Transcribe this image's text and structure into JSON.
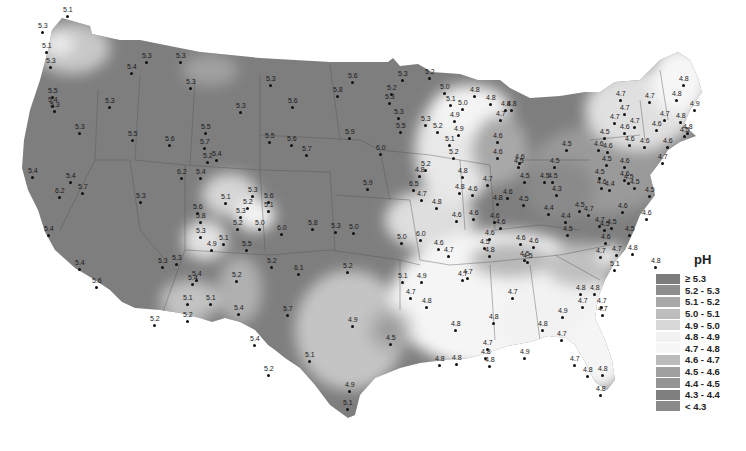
{
  "map": {
    "title": "Precipitation pH, contiguous United States",
    "legend": {
      "title": "pH",
      "items": [
        {
          "label": "≥ 5.3",
          "color": "#7c7c7c"
        },
        {
          "label": "5.2 - 5.3",
          "color": "#8e8e8e"
        },
        {
          "label": "5.1 - 5.2",
          "color": "#a8a8a8"
        },
        {
          "label": "5.0 - 5.1",
          "color": "#bdbdbd"
        },
        {
          "label": "4.9 - 5.0",
          "color": "#d8d8d8"
        },
        {
          "label": "4.8 - 4.9",
          "color": "#f2f2f2"
        },
        {
          "label": "4.7 - 4.8",
          "color": "#f7f7f7"
        },
        {
          "label": "4.6 - 4.7",
          "color": "#bcbcbc"
        },
        {
          "label": "4.5 - 4.6",
          "color": "#a0a0a0"
        },
        {
          "label": "4.4 - 4.5",
          "color": "#949494"
        },
        {
          "label": "4.3 - 4.4",
          "color": "#7e7e7e"
        },
        {
          "label": "< 4.3",
          "color": "#8a8a8a"
        }
      ]
    },
    "stations": [
      {
        "v": "5.1",
        "x": 63,
        "y": 6
      },
      {
        "v": "5.3",
        "x": 38,
        "y": 22
      },
      {
        "v": "5.1",
        "x": 42,
        "y": 42
      },
      {
        "v": "5.3",
        "x": 46,
        "y": 57
      },
      {
        "v": "5.4",
        "x": 127,
        "y": 63
      },
      {
        "v": "5.3",
        "x": 142,
        "y": 52
      },
      {
        "v": "5.3",
        "x": 176,
        "y": 52
      },
      {
        "v": "5.3",
        "x": 186,
        "y": 78
      },
      {
        "v": "5.5",
        "x": 48,
        "y": 87
      },
      {
        "v": "5.4",
        "x": 48,
        "y": 96
      },
      {
        "v": "5.3",
        "x": 50,
        "y": 101
      },
      {
        "v": "5.3",
        "x": 105,
        "y": 97
      },
      {
        "v": "5.3",
        "x": 75,
        "y": 123
      },
      {
        "v": "5.5",
        "x": 128,
        "y": 130
      },
      {
        "v": "5.6",
        "x": 165,
        "y": 135
      },
      {
        "v": "5.5",
        "x": 201,
        "y": 123
      },
      {
        "v": "5.3",
        "x": 266,
        "y": 75
      },
      {
        "v": "5.6",
        "x": 348,
        "y": 72
      },
      {
        "v": "5.8",
        "x": 333,
        "y": 86
      },
      {
        "v": "5.6",
        "x": 288,
        "y": 97
      },
      {
        "v": "5.3",
        "x": 236,
        "y": 102
      },
      {
        "v": "5.5",
        "x": 265,
        "y": 132
      },
      {
        "v": "5.6",
        "x": 287,
        "y": 135
      },
      {
        "v": "5.7",
        "x": 302,
        "y": 145
      },
      {
        "v": "5.9",
        "x": 345,
        "y": 128
      },
      {
        "v": "6.0",
        "x": 376,
        "y": 144
      },
      {
        "v": "5.2",
        "x": 425,
        "y": 68
      },
      {
        "v": "5.3",
        "x": 398,
        "y": 70
      },
      {
        "v": "5.2",
        "x": 387,
        "y": 84
      },
      {
        "v": "5.3",
        "x": 385,
        "y": 93
      },
      {
        "v": "5.3",
        "x": 394,
        "y": 108
      },
      {
        "v": "5.5",
        "x": 396,
        "y": 122
      },
      {
        "v": "5.0",
        "x": 440,
        "y": 83
      },
      {
        "v": "4.8",
        "x": 470,
        "y": 86
      },
      {
        "v": "4.8",
        "x": 486,
        "y": 94
      },
      {
        "v": "4.8",
        "x": 501,
        "y": 100
      },
      {
        "v": "5.1",
        "x": 446,
        "y": 95
      },
      {
        "v": "5.0",
        "x": 458,
        "y": 99
      },
      {
        "v": "5.3",
        "x": 421,
        "y": 115
      },
      {
        "v": "4.9",
        "x": 450,
        "y": 111
      },
      {
        "v": "5.2",
        "x": 433,
        "y": 122
      },
      {
        "v": "4.9",
        "x": 454,
        "y": 125
      },
      {
        "v": "5.1",
        "x": 445,
        "y": 135
      },
      {
        "v": "5.2",
        "x": 449,
        "y": 148
      },
      {
        "v": "4.8",
        "x": 458,
        "y": 167
      },
      {
        "v": "4.8",
        "x": 455,
        "y": 183
      },
      {
        "v": "5.2",
        "x": 421,
        "y": 160
      },
      {
        "v": "4.7",
        "x": 496,
        "y": 110
      },
      {
        "v": "4.8",
        "x": 507,
        "y": 100
      },
      {
        "v": "4.6",
        "x": 493,
        "y": 132
      },
      {
        "v": "4.6",
        "x": 493,
        "y": 148
      },
      {
        "v": "4.6",
        "x": 515,
        "y": 153
      },
      {
        "v": "4.5",
        "x": 514,
        "y": 157
      },
      {
        "v": "4.8",
        "x": 679,
        "y": 75
      },
      {
        "v": "4.8",
        "x": 672,
        "y": 90
      },
      {
        "v": "4.9",
        "x": 690,
        "y": 100
      },
      {
        "v": "4.7",
        "x": 616,
        "y": 90
      },
      {
        "v": "4.7",
        "x": 645,
        "y": 92
      },
      {
        "v": "4.7",
        "x": 620,
        "y": 104
      },
      {
        "v": "4.8",
        "x": 676,
        "y": 112
      },
      {
        "v": "4.8",
        "x": 683,
        "y": 123
      },
      {
        "v": "4.7",
        "x": 610,
        "y": 113
      },
      {
        "v": "4.7",
        "x": 660,
        "y": 110
      },
      {
        "v": "4.7",
        "x": 630,
        "y": 117
      },
      {
        "v": "4.6",
        "x": 652,
        "y": 120
      },
      {
        "v": "4.6",
        "x": 620,
        "y": 123
      },
      {
        "v": "4.5",
        "x": 680,
        "y": 126
      },
      {
        "v": "4.5",
        "x": 600,
        "y": 128
      },
      {
        "v": "4.6",
        "x": 594,
        "y": 140
      },
      {
        "v": "4.6",
        "x": 625,
        "y": 135
      },
      {
        "v": "4.6",
        "x": 640,
        "y": 137
      },
      {
        "v": "4.6",
        "x": 603,
        "y": 142
      },
      {
        "v": "4.6",
        "x": 663,
        "y": 137
      },
      {
        "v": "4.7",
        "x": 658,
        "y": 153
      },
      {
        "v": "4.5",
        "x": 562,
        "y": 140
      },
      {
        "v": "4.5",
        "x": 602,
        "y": 155
      },
      {
        "v": "4.6",
        "x": 620,
        "y": 157
      },
      {
        "v": "4.5",
        "x": 540,
        "y": 172
      },
      {
        "v": "4.5",
        "x": 550,
        "y": 157
      },
      {
        "v": "4.6",
        "x": 620,
        "y": 170
      },
      {
        "v": "4.5",
        "x": 595,
        "y": 168
      },
      {
        "v": "4.6",
        "x": 597,
        "y": 178
      },
      {
        "v": "4.4",
        "x": 605,
        "y": 180
      },
      {
        "v": "4.5",
        "x": 624,
        "y": 173
      },
      {
        "v": "4.5",
        "x": 630,
        "y": 178
      },
      {
        "v": "4.5",
        "x": 645,
        "y": 186
      },
      {
        "v": "4.5",
        "x": 520,
        "y": 172
      },
      {
        "v": "4.5",
        "x": 548,
        "y": 172
      },
      {
        "v": "4.3",
        "x": 552,
        "y": 185
      },
      {
        "v": "4.5",
        "x": 519,
        "y": 195
      },
      {
        "v": "4.4",
        "x": 544,
        "y": 204
      },
      {
        "v": "4.5",
        "x": 575,
        "y": 201
      },
      {
        "v": "4.4",
        "x": 561,
        "y": 212
      },
      {
        "v": "4.5",
        "x": 563,
        "y": 225
      },
      {
        "v": "4.7",
        "x": 595,
        "y": 216
      },
      {
        "v": "4.7",
        "x": 584,
        "y": 205
      },
      {
        "v": "4.5",
        "x": 600,
        "y": 220
      },
      {
        "v": "4.6",
        "x": 618,
        "y": 202
      },
      {
        "v": "4.5",
        "x": 607,
        "y": 218
      },
      {
        "v": "4.6",
        "x": 642,
        "y": 209
      },
      {
        "v": "4.5",
        "x": 625,
        "y": 225
      },
      {
        "v": "4.6",
        "x": 601,
        "y": 233
      },
      {
        "v": "4.8",
        "x": 493,
        "y": 194
      },
      {
        "v": "4.7",
        "x": 483,
        "y": 175
      },
      {
        "v": "4.6",
        "x": 503,
        "y": 188
      },
      {
        "v": "4.6",
        "x": 496,
        "y": 218
      },
      {
        "v": "4.6",
        "x": 516,
        "y": 234
      },
      {
        "v": "4.5",
        "x": 480,
        "y": 238
      },
      {
        "v": "4.8",
        "x": 485,
        "y": 246
      },
      {
        "v": "4.6",
        "x": 529,
        "y": 237
      },
      {
        "v": "4.5",
        "x": 523,
        "y": 252
      },
      {
        "v": "4.7",
        "x": 596,
        "y": 247
      },
      {
        "v": "4.7",
        "x": 612,
        "y": 245
      },
      {
        "v": "4.8",
        "x": 628,
        "y": 244
      },
      {
        "v": "5.1",
        "x": 610,
        "y": 260
      },
      {
        "v": "4.8",
        "x": 651,
        "y": 257
      },
      {
        "v": "4.8",
        "x": 415,
        "y": 166
      },
      {
        "v": "4.7",
        "x": 417,
        "y": 190
      },
      {
        "v": "4.8",
        "x": 432,
        "y": 198
      },
      {
        "v": "4.6",
        "x": 468,
        "y": 185
      },
      {
        "v": "4.6",
        "x": 469,
        "y": 209
      },
      {
        "v": "4.6",
        "x": 452,
        "y": 211
      },
      {
        "v": "4.6",
        "x": 490,
        "y": 212
      },
      {
        "v": "5.0",
        "x": 397,
        "y": 233
      },
      {
        "v": "6.0",
        "x": 416,
        "y": 230
      },
      {
        "v": "4.7",
        "x": 444,
        "y": 246
      },
      {
        "v": "4.6",
        "x": 434,
        "y": 239
      },
      {
        "v": "4.6",
        "x": 485,
        "y": 229
      },
      {
        "v": "4.5",
        "x": 520,
        "y": 250
      },
      {
        "v": "4.7",
        "x": 463,
        "y": 268
      },
      {
        "v": "4.7",
        "x": 458,
        "y": 270
      },
      {
        "v": "5.1",
        "x": 398,
        "y": 272
      },
      {
        "v": "4.9",
        "x": 417,
        "y": 272
      },
      {
        "v": "4.7",
        "x": 406,
        "y": 288
      },
      {
        "v": "4.8",
        "x": 422,
        "y": 297
      },
      {
        "v": "4.7",
        "x": 508,
        "y": 288
      },
      {
        "v": "4.8",
        "x": 576,
        "y": 284
      },
      {
        "v": "4.8",
        "x": 590,
        "y": 284
      },
      {
        "v": "4.7",
        "x": 578,
        "y": 297
      },
      {
        "v": "4.7",
        "x": 597,
        "y": 297
      },
      {
        "v": "4.7",
        "x": 598,
        "y": 305
      },
      {
        "v": "4.9",
        "x": 558,
        "y": 307
      },
      {
        "v": "4.8",
        "x": 489,
        "y": 313
      },
      {
        "v": "4.8",
        "x": 451,
        "y": 320
      },
      {
        "v": "4.8",
        "x": 538,
        "y": 320
      },
      {
        "v": "4.7",
        "x": 557,
        "y": 330
      },
      {
        "v": "4.7",
        "x": 483,
        "y": 339
      },
      {
        "v": "4.8",
        "x": 452,
        "y": 354
      },
      {
        "v": "4.9",
        "x": 520,
        "y": 348
      },
      {
        "v": "4.8",
        "x": 481,
        "y": 348
      },
      {
        "v": "4.8",
        "x": 435,
        "y": 355
      },
      {
        "v": "4.8",
        "x": 485,
        "y": 356
      },
      {
        "v": "4.7",
        "x": 570,
        "y": 355
      },
      {
        "v": "4.8",
        "x": 583,
        "y": 366
      },
      {
        "v": "4.8",
        "x": 598,
        "y": 365
      },
      {
        "v": "4.8",
        "x": 596,
        "y": 385
      },
      {
        "v": "4.5",
        "x": 386,
        "y": 334
      },
      {
        "v": "5.2",
        "x": 203,
        "y": 152
      },
      {
        "v": "5.4",
        "x": 212,
        "y": 150
      },
      {
        "v": "5.7",
        "x": 200,
        "y": 138
      },
      {
        "v": "6.2",
        "x": 177,
        "y": 168
      },
      {
        "v": "5.4",
        "x": 196,
        "y": 168
      },
      {
        "v": "5.3",
        "x": 248,
        "y": 186
      },
      {
        "v": "5.6",
        "x": 264,
        "y": 192
      },
      {
        "v": "5.1",
        "x": 221,
        "y": 193
      },
      {
        "v": "5.2",
        "x": 243,
        "y": 198
      },
      {
        "v": "5.1",
        "x": 264,
        "y": 201
      },
      {
        "v": "5.3",
        "x": 236,
        "y": 207
      },
      {
        "v": "5.2",
        "x": 233,
        "y": 219
      },
      {
        "v": "5.0",
        "x": 255,
        "y": 219
      },
      {
        "v": "6.0",
        "x": 277,
        "y": 224
      },
      {
        "v": "5.8",
        "x": 308,
        "y": 219
      },
      {
        "v": "5.1",
        "x": 219,
        "y": 234
      },
      {
        "v": "4.9",
        "x": 207,
        "y": 240
      },
      {
        "v": "5.5",
        "x": 242,
        "y": 240
      },
      {
        "v": "5.3",
        "x": 331,
        "y": 222
      },
      {
        "v": "5.0",
        "x": 349,
        "y": 223
      },
      {
        "v": "5.6",
        "x": 193,
        "y": 203
      },
      {
        "v": "5.8",
        "x": 196,
        "y": 212
      },
      {
        "v": "5.3",
        "x": 196,
        "y": 227
      },
      {
        "v": "5.3",
        "x": 158,
        "y": 257
      },
      {
        "v": "5.2",
        "x": 267,
        "y": 257
      },
      {
        "v": "5.2",
        "x": 232,
        "y": 271
      },
      {
        "v": "5.4",
        "x": 192,
        "y": 270
      },
      {
        "v": "6.1",
        "x": 294,
        "y": 264
      },
      {
        "v": "5.2",
        "x": 343,
        "y": 262
      },
      {
        "v": "5.9",
        "x": 363,
        "y": 179
      },
      {
        "v": "6.5",
        "x": 409,
        "y": 180
      },
      {
        "v": "5.4",
        "x": 28,
        "y": 167
      },
      {
        "v": "5.4",
        "x": 66,
        "y": 172
      },
      {
        "v": "6.2",
        "x": 55,
        "y": 187
      },
      {
        "v": "5.7",
        "x": 78,
        "y": 183
      },
      {
        "v": "5.3",
        "x": 136,
        "y": 192
      },
      {
        "v": "5.4",
        "x": 44,
        "y": 225
      },
      {
        "v": "5.4",
        "x": 75,
        "y": 259
      },
      {
        "v": "5.6",
        "x": 92,
        "y": 277
      },
      {
        "v": "5.3",
        "x": 172,
        "y": 254
      },
      {
        "v": "5.4",
        "x": 188,
        "y": 274
      },
      {
        "v": "5.1",
        "x": 183,
        "y": 294
      },
      {
        "v": "5.1",
        "x": 206,
        "y": 294
      },
      {
        "v": "5.2",
        "x": 150,
        "y": 315
      },
      {
        "v": "5.2",
        "x": 183,
        "y": 311
      },
      {
        "v": "5.4",
        "x": 234,
        "y": 304
      },
      {
        "v": "5.7",
        "x": 283,
        "y": 305
      },
      {
        "v": "5.4",
        "x": 250,
        "y": 335
      },
      {
        "v": "5.2",
        "x": 264,
        "y": 365
      },
      {
        "v": "5.1",
        "x": 305,
        "y": 351
      },
      {
        "v": "4.9",
        "x": 348,
        "y": 316
      },
      {
        "v": "4.9",
        "x": 345,
        "y": 381
      },
      {
        "v": "5.1",
        "x": 343,
        "y": 399
      }
    ]
  }
}
